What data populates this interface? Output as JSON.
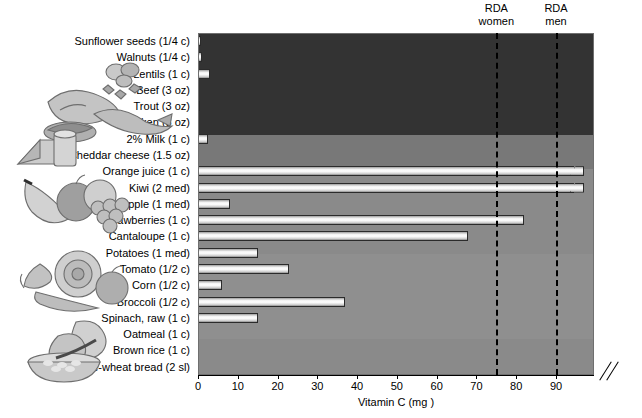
{
  "chart_data": {
    "type": "bar",
    "orientation": "horizontal",
    "title": "",
    "xlabel": "Vitamin C (mg )",
    "ylabel": "",
    "xlim": [
      0,
      96
    ],
    "xticks": [
      0,
      10,
      20,
      30,
      40,
      50,
      60,
      70,
      80,
      90
    ],
    "grid": false,
    "axis_break": true,
    "axis_break_note": "Axis broken after 90 mg; Orange juice and Kiwi bars exceed the scale",
    "categories": [
      "Sunflower seeds (1/4 c)",
      "Walnuts (1/4 c)",
      "Lentils (1 c)",
      "Beef (3 oz)",
      "Trout (3 oz)",
      "Chicken (3 oz)",
      "2% Milk (1 c)",
      "Cheddar cheese (1.5 oz)",
      "Orange juice (1 c)",
      "Kiwi (2 med)",
      "Apple (1 med)",
      "Strawberries (1 c)",
      "Cantaloupe (1 c)",
      "Potatoes (1 med)",
      "Tomato (1/2 c)",
      "Corn (1/2 c)",
      "Broccoli (1/2 c)",
      "Spinach, raw (1 c)",
      "Oatmeal (1 c)",
      "Brown rice (1 c)",
      "Whole-wheat bread (2 sl)"
    ],
    "values": [
      0.7,
      1.0,
      3.0,
      0.0,
      0.5,
      0.0,
      2.5,
      0.0,
      96,
      96,
      8,
      82,
      68,
      15,
      23,
      6,
      37,
      15,
      0,
      0,
      0
    ],
    "annotations": [
      {
        "label": "RDA women",
        "value": 75
      },
      {
        "label": "RDA men",
        "value": 90
      }
    ],
    "food_groups": [
      {
        "name": "protein-foods",
        "start": 0,
        "end": 7,
        "shade": "#333333"
      },
      {
        "name": "dairy",
        "start": 6,
        "end": 7,
        "shade": "#787878"
      },
      {
        "name": "fruits",
        "start": 8,
        "end": 12,
        "shade": "#8a8a8a"
      },
      {
        "name": "vegetables",
        "start": 13,
        "end": 17,
        "shade": "#8f8f8f"
      },
      {
        "name": "grains",
        "start": 18,
        "end": 20,
        "shade": "#8a8a8a"
      }
    ]
  },
  "axis": {
    "x_title": "Vitamin C (mg )",
    "tick_labels": [
      "0",
      "10",
      "20",
      "30",
      "40",
      "50",
      "60",
      "70",
      "80",
      "90"
    ]
  },
  "markers": {
    "women_line1": "RDA",
    "women_line2": "women",
    "men_line1": "RDA",
    "men_line2": "men"
  },
  "illustrations": [
    {
      "name": "nuts-meat-fish-illustration",
      "alt": "sunflower seeds, walnuts, beef, trout"
    },
    {
      "name": "dairy-illustration",
      "alt": "cheese wedge and milk glass"
    },
    {
      "name": "fruit-illustration",
      "alt": "banana, apple and grapes"
    },
    {
      "name": "vegetable-illustration",
      "alt": "cabbage, tomato, carrot"
    },
    {
      "name": "grains-illustration",
      "alt": "bowl of oatmeal and bread slices"
    }
  ]
}
